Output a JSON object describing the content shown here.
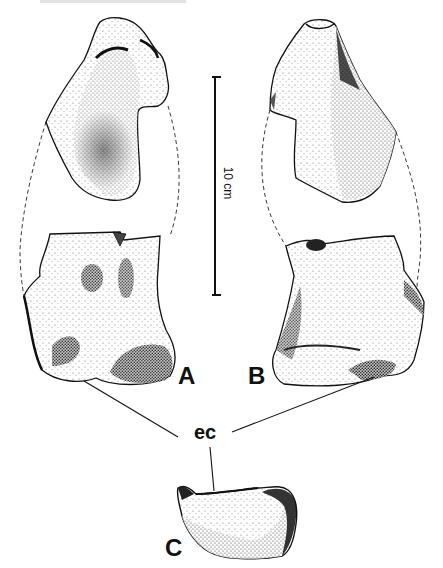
{
  "figure": {
    "panels": [
      {
        "id": "A",
        "label": "A"
      },
      {
        "id": "B",
        "label": "B"
      },
      {
        "id": "C",
        "label": "C"
      }
    ],
    "annotation": {
      "label": "ec"
    },
    "scale_bar": {
      "label": "10 cm"
    }
  },
  "colors": {
    "ink": "#111111",
    "paper": "#ffffff",
    "stipple_dark": "#1a1a1a",
    "stipple_mid": "#777777",
    "stipple_light": "#d8d8d8"
  }
}
